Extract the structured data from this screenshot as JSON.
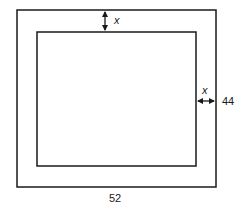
{
  "diagram": {
    "type": "frame-with-border",
    "outer_rect": {
      "x": 17,
      "y": 10,
      "width": 199,
      "height": 177
    },
    "inner_rect": {
      "x": 37,
      "y": 32,
      "width": 159,
      "height": 134
    },
    "labels": {
      "top_border_width": "x",
      "right_border_width": "x",
      "outer_height": "44",
      "outer_width": "52"
    },
    "colors": {
      "stroke": "#1a1a1a",
      "background": "#ffffff"
    }
  }
}
